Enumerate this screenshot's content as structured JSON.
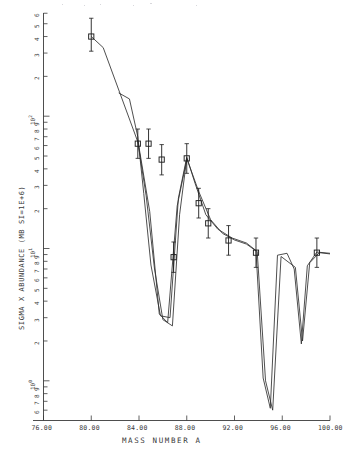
{
  "chart_data": {
    "type": "scatter",
    "title": "",
    "xlabel": "MASS NUMBER A",
    "ylabel": "SIGMA X ABUNDANCE (MB SI=1E+6)",
    "xlim": [
      76.0,
      100.0
    ],
    "ylim_log10": [
      -0.3,
      2.78
    ],
    "yscale": "log",
    "xscale": "linear",
    "grid": false,
    "legend": null,
    "xticks": [
      "76.00",
      "80.00",
      "84.00",
      "88.00",
      "92.00",
      "96.00",
      "100.00"
    ],
    "xtick_values": [
      76,
      80,
      84,
      88,
      92,
      96,
      100
    ],
    "ytick_decades": [
      "10",
      "10",
      "10"
    ],
    "ytick_exponents": [
      "0",
      "1",
      "2"
    ],
    "ytick_minor_labels": [
      "2",
      "3",
      "4",
      "5",
      "6",
      "7",
      "8",
      "9"
    ],
    "series": [
      {
        "name": "measured data",
        "type": "scatter",
        "marker": "square",
        "errorbars": "vertical",
        "points": [
          {
            "x": 80.0,
            "y": 400.0,
            "yerr_lo": 90.0,
            "yerr_hi": 150.0
          },
          {
            "x": 83.9,
            "y": 62.0,
            "yerr_lo": 14.0,
            "yerr_hi": 18.0
          },
          {
            "x": 84.8,
            "y": 62.0,
            "yerr_lo": 14.0,
            "yerr_hi": 18.0
          },
          {
            "x": 85.9,
            "y": 47.0,
            "yerr_lo": 11.0,
            "yerr_hi": 14.0
          },
          {
            "x": 86.9,
            "y": 8.6,
            "yerr_lo": 2.0,
            "yerr_hi": 2.6
          },
          {
            "x": 88.0,
            "y": 48.0,
            "yerr_lo": 11.0,
            "yerr_hi": 14.0
          },
          {
            "x": 89.0,
            "y": 22.0,
            "yerr_lo": 5.0,
            "yerr_hi": 6.5
          },
          {
            "x": 89.8,
            "y": 15.5,
            "yerr_lo": 3.5,
            "yerr_hi": 4.5
          },
          {
            "x": 91.5,
            "y": 11.5,
            "yerr_lo": 2.6,
            "yerr_hi": 3.4
          },
          {
            "x": 93.8,
            "y": 9.3,
            "yerr_lo": 2.1,
            "yerr_hi": 2.7
          },
          {
            "x": 98.9,
            "y": 9.3,
            "yerr_lo": 2.1,
            "yerr_hi": 2.7
          }
        ]
      },
      {
        "name": "model curve 1",
        "type": "line",
        "points": [
          {
            "x": 80.0,
            "y": 400.0
          },
          {
            "x": 81.0,
            "y": 330.0
          },
          {
            "x": 83.9,
            "y": 64.0
          },
          {
            "x": 84.6,
            "y": 25.0
          },
          {
            "x": 85.3,
            "y": 7.0
          },
          {
            "x": 86.0,
            "y": 2.9
          },
          {
            "x": 86.8,
            "y": 2.6
          },
          {
            "x": 87.4,
            "y": 18.0
          },
          {
            "x": 88.0,
            "y": 48.0
          },
          {
            "x": 89.0,
            "y": 27.0
          },
          {
            "x": 90.0,
            "y": 16.5
          },
          {
            "x": 91.0,
            "y": 13.0
          },
          {
            "x": 92.0,
            "y": 11.6
          },
          {
            "x": 93.0,
            "y": 10.8
          },
          {
            "x": 93.8,
            "y": 9.6
          },
          {
            "x": 94.4,
            "y": 1.05
          },
          {
            "x": 95.0,
            "y": 0.62
          },
          {
            "x": 95.6,
            "y": 8.9
          },
          {
            "x": 96.4,
            "y": 9.2
          },
          {
            "x": 97.0,
            "y": 7.0
          },
          {
            "x": 97.6,
            "y": 1.9
          },
          {
            "x": 98.1,
            "y": 7.4
          },
          {
            "x": 98.9,
            "y": 9.4
          },
          {
            "x": 100.0,
            "y": 9.2
          }
        ]
      },
      {
        "name": "model curve 2",
        "type": "line",
        "points": [
          {
            "x": 82.3,
            "y": 150.0
          },
          {
            "x": 83.2,
            "y": 135.0
          },
          {
            "x": 83.9,
            "y": 70.0
          },
          {
            "x": 84.4,
            "y": 26.0
          },
          {
            "x": 85.0,
            "y": 7.5
          },
          {
            "x": 85.8,
            "y": 3.1
          },
          {
            "x": 86.6,
            "y": 3.0
          },
          {
            "x": 87.3,
            "y": 24.0
          },
          {
            "x": 88.0,
            "y": 49.0
          },
          {
            "x": 88.7,
            "y": 31.0
          },
          {
            "x": 89.6,
            "y": 18.0
          },
          {
            "x": 90.6,
            "y": 14.0
          },
          {
            "x": 91.8,
            "y": 12.0
          },
          {
            "x": 93.0,
            "y": 11.0
          },
          {
            "x": 93.9,
            "y": 9.5
          },
          {
            "x": 94.6,
            "y": 1.0
          },
          {
            "x": 95.2,
            "y": 0.6
          },
          {
            "x": 95.9,
            "y": 8.7
          },
          {
            "x": 97.1,
            "y": 7.2
          },
          {
            "x": 97.7,
            "y": 2.0
          },
          {
            "x": 98.3,
            "y": 7.8
          },
          {
            "x": 99.1,
            "y": 9.3
          },
          {
            "x": 100.0,
            "y": 9.1
          }
        ]
      },
      {
        "name": "model curve 3",
        "type": "line",
        "points": [
          {
            "x": 83.9,
            "y": 66.0
          },
          {
            "x": 84.9,
            "y": 19.0
          },
          {
            "x": 85.7,
            "y": 3.2
          },
          {
            "x": 86.4,
            "y": 2.75
          },
          {
            "x": 87.2,
            "y": 21.0
          },
          {
            "x": 88.0,
            "y": 47.0
          }
        ]
      }
    ]
  }
}
